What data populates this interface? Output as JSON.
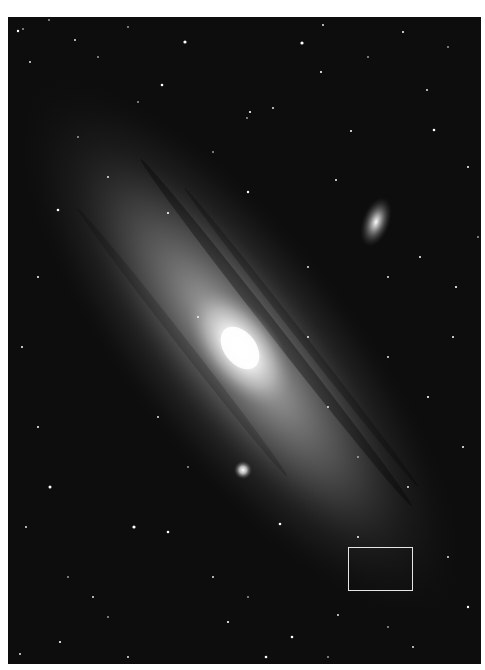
{
  "image": {
    "subject": "Andromeda Galaxy (M31) with satellite galaxies",
    "colors": {
      "background": "#ffffff",
      "sky": "#0d0d0d",
      "highlight_border": "#e6e6e6"
    },
    "frame": {
      "x": 8,
      "y": 17,
      "width": 473,
      "height": 647
    },
    "objects": [
      {
        "name": "galaxy-core",
        "cx": 240,
        "cy": 348
      },
      {
        "name": "satellite-galaxy-upper",
        "cx": 376,
        "cy": 222
      },
      {
        "name": "satellite-galaxy-lower",
        "cx": 243,
        "cy": 470
      }
    ],
    "highlight_box": {
      "x": 348,
      "y": 547,
      "width": 65,
      "height": 44
    }
  }
}
